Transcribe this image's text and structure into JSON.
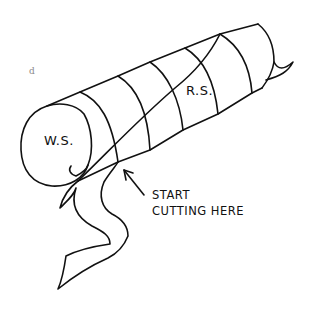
{
  "figure": {
    "panel_label": "d",
    "labels": {
      "wrong_side": "W.S.",
      "right_side": "R.S.",
      "instruction_line1": "START",
      "instruction_line2": "CUTTING HERE"
    },
    "stroke_color": "#111111",
    "background": "#ffffff"
  }
}
